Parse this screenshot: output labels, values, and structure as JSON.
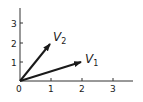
{
  "diagram": {
    "type": "vector-plot",
    "axes": {
      "origin_label": "0",
      "x_ticks": [
        "1",
        "2",
        "3"
      ],
      "y_ticks": [
        "1",
        "2",
        "3"
      ]
    },
    "vectors": [
      {
        "name": "V1",
        "letter": "V",
        "subscript": "1",
        "from": [
          0,
          0
        ],
        "to": [
          2,
          1
        ]
      },
      {
        "name": "V2",
        "letter": "V",
        "subscript": "2",
        "from": [
          0,
          0
        ],
        "to": [
          1,
          2
        ]
      }
    ],
    "colors": {
      "ink": "#1a1a1a",
      "background": "#ffffff"
    }
  }
}
